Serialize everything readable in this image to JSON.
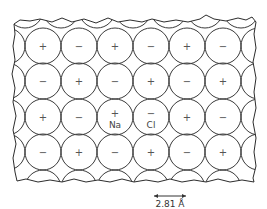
{
  "diagram": {
    "type": "crystal-lattice",
    "rows": [
      [
        "+",
        "−",
        "+",
        "−",
        "+",
        "−"
      ],
      [
        "−",
        "+",
        "−",
        "+",
        "−",
        "+"
      ],
      [
        "+",
        "−",
        "+",
        "−",
        "+",
        "−"
      ],
      [
        "−",
        "+",
        "−",
        "+",
        "−",
        "+"
      ]
    ],
    "labels": {
      "cation": "Na",
      "anion": "Cl"
    },
    "labeled_ions": [
      {
        "row": 2,
        "col": 2,
        "label": "Na",
        "charge": "+"
      },
      {
        "row": 2,
        "col": 3,
        "label": "Cl",
        "charge": "−"
      }
    ],
    "scale_bar": {
      "label": "2.81 Å"
    },
    "colors": {
      "stroke": "#3a3a3a",
      "text": "#555555",
      "background": "#ffffff"
    }
  }
}
